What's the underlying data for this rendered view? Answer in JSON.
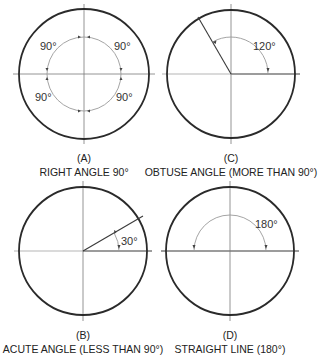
{
  "figures": [
    {
      "id": "A",
      "letter": "(A)",
      "caption": "RIGHT ANGLE 90°",
      "angle_labels": [
        "90°",
        "90°",
        "90°",
        "90°"
      ]
    },
    {
      "id": "C",
      "letter": "(C)",
      "caption": "OBTUSE ANGLE (MORE THAN 90°)",
      "angle_labels": [
        "120°"
      ]
    },
    {
      "id": "B",
      "letter": "(B)",
      "caption": "ACUTE ANGLE (LESS THAN 90°)",
      "angle_labels": [
        "30°"
      ]
    },
    {
      "id": "D",
      "letter": "(D)",
      "caption": "STRAIGHT LINE (180°)",
      "angle_labels": [
        "180°"
      ]
    }
  ]
}
